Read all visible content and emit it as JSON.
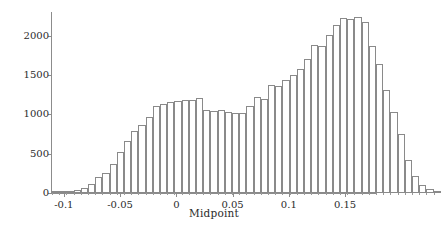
{
  "chart_data": {
    "type": "bar",
    "title": "",
    "subtitle": "",
    "xlabel": "Midpoint",
    "ylabel": "Frequency",
    "xlim": [
      -0.1105,
      0.1775
    ],
    "ylim": [
      0,
      2300
    ],
    "xticks": [
      -0.1,
      -0.05,
      0,
      0.05,
      0.1,
      0.15
    ],
    "xtick_labels": [
      "-0.1",
      "-0.05",
      "0",
      "0.05",
      "0.1",
      "0.15"
    ],
    "yticks": [
      0,
      500,
      1000,
      1500,
      2000
    ],
    "ytick_labels": [
      "0",
      "500",
      "1000",
      "1500",
      "2000"
    ],
    "grid": false,
    "legend": "none",
    "bin_width": 0.0064,
    "bar_face_color": "#ffffff",
    "bar_edge_color": "#8a8a8a",
    "axis_color": "#8c8c8c",
    "categories": [
      "-0.1073",
      "-0.1009",
      "-0.0945",
      "-0.0881",
      "-0.0817",
      "-0.0753",
      "-0.0689",
      "-0.0625",
      "-0.0561",
      "-0.0497",
      "-0.0433",
      "-0.0369",
      "-0.0305",
      "-0.0241",
      "-0.0177",
      "-0.0113",
      "-0.0049",
      "0.0015",
      "0.0079",
      "0.0143",
      "0.0207",
      "0.0271",
      "0.0335",
      "0.0399",
      "0.0463",
      "0.0527",
      "0.0591",
      "0.0655",
      "0.0719",
      "0.0783",
      "0.0847",
      "0.0911",
      "0.0975",
      "0.1039",
      "0.1103",
      "0.1167",
      "0.1231",
      "0.1295",
      "0.1359",
      "0.1423",
      "0.1487",
      "0.1551",
      "0.1615",
      "0.1679",
      "0.1743"
    ],
    "values": [
      5,
      12,
      18,
      40,
      62,
      110,
      200,
      255,
      375,
      520,
      660,
      790,
      870,
      960,
      1100,
      1135,
      1160,
      1175,
      1180,
      1185,
      1205,
      1055,
      1045,
      1055,
      1025,
      1015,
      1020,
      1100,
      1215,
      1200,
      1370,
      1365,
      1430,
      1500,
      1570,
      1700,
      1875,
      1865,
      2010,
      2130,
      2230,
      2215,
      2235,
      2170,
      1865
    ],
    "values_tail": [
      1645,
      1310,
      1025,
      750,
      420,
      215,
      105,
      55,
      20
    ]
  }
}
